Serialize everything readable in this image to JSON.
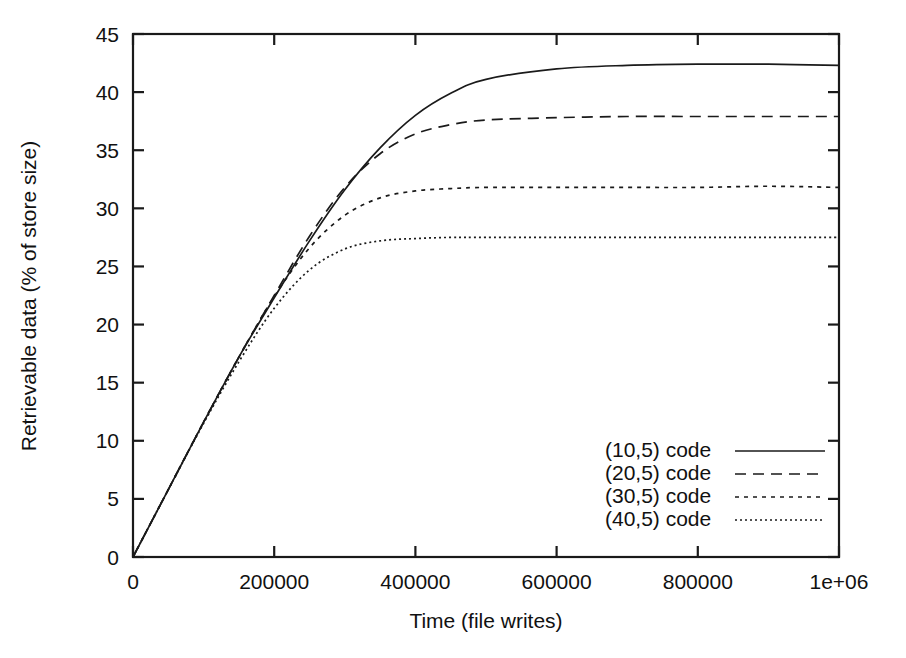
{
  "chart_data": {
    "type": "line",
    "title": "",
    "xlabel": "Time (file writes)",
    "ylabel": "Retrievable data (% of store size)",
    "xlim": [
      0,
      1000000
    ],
    "ylim": [
      0,
      45
    ],
    "grid": false,
    "legend_position": "bottom-right",
    "xticks": [
      0,
      200000,
      400000,
      600000,
      800000,
      1000000
    ],
    "xticklabels": [
      "0",
      "200000",
      "400000",
      "600000",
      "800000",
      "1e+06"
    ],
    "yticks": [
      0,
      5,
      10,
      15,
      20,
      25,
      30,
      35,
      40,
      45
    ],
    "yticklabels": [
      "0",
      "5",
      "10",
      "15",
      "20",
      "25",
      "30",
      "35",
      "40",
      "45"
    ],
    "x": [
      0,
      50000,
      100000,
      150000,
      200000,
      250000,
      300000,
      350000,
      400000,
      450000,
      500000,
      600000,
      700000,
      800000,
      900000,
      1000000
    ],
    "series": [
      {
        "name": "(10,5) code",
        "style": "solid",
        "plateau": 42.3,
        "values": [
          0.0,
          5.8,
          11.6,
          17.2,
          22.3,
          27.2,
          31.6,
          35.2,
          38.0,
          39.9,
          41.1,
          42.0,
          42.3,
          42.4,
          42.4,
          42.3
        ]
      },
      {
        "name": "(20,5) code",
        "style": "dashed",
        "plateau": 37.9,
        "values": [
          0.0,
          5.8,
          11.6,
          17.2,
          22.5,
          27.6,
          31.8,
          34.7,
          36.4,
          37.2,
          37.6,
          37.8,
          37.9,
          37.9,
          37.9,
          37.9
        ]
      },
      {
        "name": "(30,5) code",
        "style": "dotted",
        "plateau": 31.8,
        "values": [
          0.0,
          5.8,
          11.6,
          17.2,
          22.4,
          26.6,
          29.4,
          30.9,
          31.5,
          31.7,
          31.8,
          31.8,
          31.8,
          31.8,
          31.9,
          31.8
        ]
      },
      {
        "name": "(40,5) code",
        "style": "fine",
        "plateau": 27.5,
        "values": [
          0.0,
          5.8,
          11.5,
          16.8,
          21.4,
          24.7,
          26.5,
          27.2,
          27.4,
          27.5,
          27.5,
          27.5,
          27.5,
          27.5,
          27.5,
          27.5
        ]
      }
    ]
  },
  "axes": {
    "x_title": "Time (file writes)",
    "y_title": "Retrievable data (% of store size)"
  },
  "legend": {
    "items": [
      {
        "label": "(10,5) code",
        "style": "solid"
      },
      {
        "label": "(20,5) code",
        "style": "dashed"
      },
      {
        "label": "(30,5) code",
        "style": "dotted"
      },
      {
        "label": "(40,5) code",
        "style": "fine"
      }
    ]
  },
  "colors": {
    "ink": "#1a1a1a",
    "background": "#ffffff"
  }
}
